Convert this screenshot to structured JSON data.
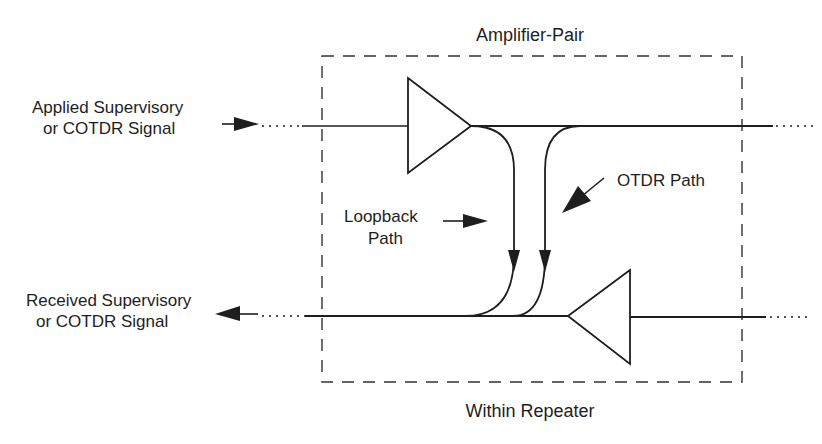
{
  "diagram": {
    "title_top": "Amplifier-Pair",
    "title_bottom": "Within Repeater",
    "labels": {
      "applied_line1": "Applied  Supervisory",
      "applied_line2": "or COTDR Signal",
      "received_line1": "Received  Supervisory",
      "received_line2": "or COTDR Signal",
      "loopback_line1": "Loopback",
      "loopback_line2": "Path",
      "otdr": "OTDR  Path"
    },
    "components": [
      {
        "id": "amplifier-forward",
        "type": "amplifier",
        "direction": "right"
      },
      {
        "id": "amplifier-return",
        "type": "amplifier",
        "direction": "left"
      },
      {
        "id": "loopback-path",
        "type": "coupler-path",
        "from": "forward-output",
        "to": "return-output"
      },
      {
        "id": "otdr-path",
        "type": "coupler-path",
        "from": "forward-line",
        "to": "return-output"
      }
    ],
    "colors": {
      "line": "#1e1e1e",
      "background": "#ffffff"
    }
  }
}
